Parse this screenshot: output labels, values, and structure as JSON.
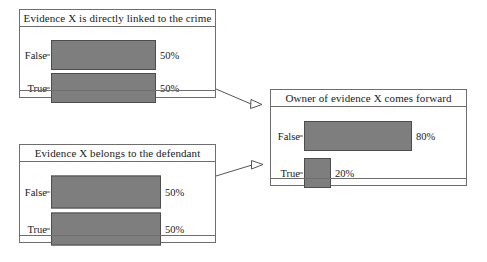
{
  "diagram": {
    "type": "bayesian-network",
    "background_color": "#ffffff",
    "bar_color": "#7e7e7e",
    "bar_border_color": "#4d4d4d",
    "node_border_color": "#6e6e6e",
    "edge_color": "#555555",
    "nodes": [
      {
        "id": "evidence-linked-to-crime",
        "title": "Evidence X is directly linked to the crime",
        "states": [
          {
            "label": "False",
            "value": 50,
            "value_label": "50%"
          },
          {
            "label": "True",
            "value": 50,
            "value_label": "50%"
          }
        ]
      },
      {
        "id": "evidence-belongs-to-defendant",
        "title": "Evidence X belongs to the defendant",
        "states": [
          {
            "label": "False",
            "value": 50,
            "value_label": "50%"
          },
          {
            "label": "True",
            "value": 50,
            "value_label": "50%"
          }
        ]
      },
      {
        "id": "owner-comes-forward",
        "title": "Owner of evidence X comes forward",
        "states": [
          {
            "label": "False",
            "value": 80,
            "value_label": "80%"
          },
          {
            "label": "True",
            "value": 20,
            "value_label": "20%"
          }
        ]
      }
    ],
    "edges": [
      {
        "from": "evidence-linked-to-crime",
        "to": "owner-comes-forward"
      },
      {
        "from": "evidence-belongs-to-defendant",
        "to": "owner-comes-forward"
      }
    ]
  }
}
